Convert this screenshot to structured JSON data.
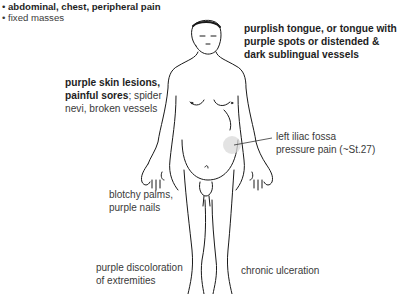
{
  "figure": {
    "highlight_color": "#d9d9d9",
    "line_color": "#1a1a1a"
  },
  "top_list": {
    "items": [
      {
        "bullet": "•",
        "text": "abdominal, chest, peripheral pain",
        "bold": true
      },
      {
        "bullet": "•",
        "text": "fixed masses",
        "bold": false
      }
    ]
  },
  "annotations": {
    "tongue": {
      "line1": "purplish tongue, or tongue with",
      "line2": "purple spots or distended &",
      "line3": "dark sublingual vessels"
    },
    "skin": {
      "bold1": "purple skin lesions,",
      "bold2": "painful sores",
      "rest2": "; spider",
      "line3": "nevi, broken vessels"
    },
    "iliac": {
      "line1": "left iliac fossa",
      "line2": "pressure pain (~St.27)"
    },
    "palms": {
      "line1": "blotchy palms,",
      "line2": "purple nails"
    },
    "extremities": {
      "line1": "purple discoloration",
      "line2": "of extremities"
    },
    "ulceration": {
      "line1": "chronic ulceration"
    }
  }
}
